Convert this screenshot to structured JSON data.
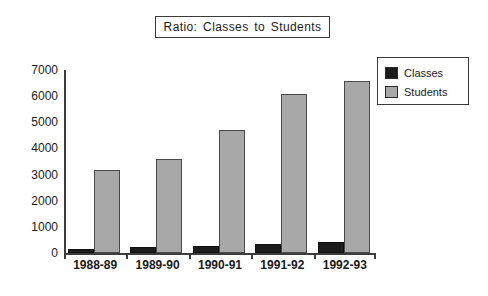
{
  "chart_data": {
    "type": "bar",
    "title": "Ratio: Classes to Students",
    "xlabel": "",
    "ylabel": "",
    "categories": [
      "1988-89",
      "1989-90",
      "1990-91",
      "1991-92",
      "1992-93"
    ],
    "series": [
      {
        "name": "Classes",
        "color": "#1c1c1c",
        "values": [
          150,
          220,
          250,
          330,
          420
        ]
      },
      {
        "name": "Students",
        "color": "#a8a8a8",
        "values": [
          3170,
          3600,
          4720,
          6070,
          6580
        ]
      }
    ],
    "ylim": [
      0,
      7000
    ],
    "yticks": [
      0,
      1000,
      2000,
      3000,
      4000,
      5000,
      6000,
      7000
    ],
    "ytick_labels": [
      "0",
      "1000",
      "2000",
      "3000",
      "4000",
      "5000",
      "6000",
      "7000"
    ],
    "grid": false,
    "legend_position": "right-top",
    "legend_entries": [
      "Classes",
      "Students"
    ]
  }
}
